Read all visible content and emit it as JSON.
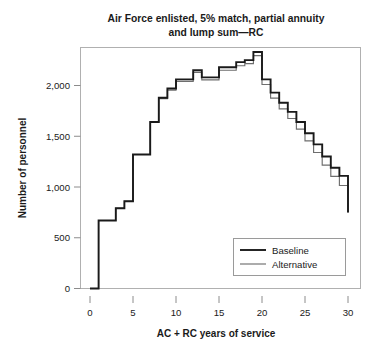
{
  "chart_data": {
    "type": "line",
    "subtype": "step-post",
    "title": "Air Force enlisted, 5% match, partial annuity and lump sum—RC",
    "title_lines": [
      "Air Force enlisted, 5% match, partial annuity",
      "and lump sum—RC"
    ],
    "xlabel": "AC + RC years of service",
    "ylabel": "Number of personnel",
    "xlim": [
      0,
      31
    ],
    "ylim": [
      0,
      2500
    ],
    "xticks": [
      0,
      5,
      10,
      15,
      20,
      25,
      30
    ],
    "xtick_labels": [
      "0",
      "5",
      "10",
      "15",
      "20",
      "25",
      "30"
    ],
    "yticks": [
      0,
      500,
      1000,
      1500,
      2000
    ],
    "ytick_labels": [
      "0",
      "500",
      "1,000",
      "1,500",
      "2,000"
    ],
    "grid": false,
    "legend_position": "lower-right",
    "x": [
      0,
      1,
      2,
      3,
      4,
      5,
      6,
      7,
      8,
      9,
      10,
      11,
      12,
      13,
      14,
      15,
      16,
      17,
      18,
      19,
      20,
      21,
      22,
      23,
      24,
      25,
      26,
      27,
      28,
      29,
      30
    ],
    "series": [
      {
        "name": "Baseline",
        "color": "#1a1a1a",
        "values": [
          0,
          670,
          670,
          790,
          860,
          1320,
          1320,
          1640,
          1880,
          1970,
          2060,
          2060,
          2150,
          2080,
          2080,
          2180,
          2180,
          2230,
          2250,
          2330,
          2060,
          1930,
          1830,
          1740,
          1640,
          1530,
          1420,
          1300,
          1190,
          1110,
          750
        ]
      },
      {
        "name": "Alternative",
        "color": "#6e6e6e",
        "values": [
          0,
          670,
          670,
          790,
          860,
          1320,
          1320,
          1640,
          1870,
          1955,
          2040,
          2040,
          2130,
          2055,
          2055,
          2150,
          2150,
          2195,
          2215,
          2295,
          2010,
          1875,
          1770,
          1675,
          1570,
          1455,
          1340,
          1215,
          1105,
          1015,
          750
        ]
      }
    ]
  },
  "legend": {
    "items": [
      {
        "label": "Baseline"
      },
      {
        "label": "Alternative"
      }
    ]
  }
}
